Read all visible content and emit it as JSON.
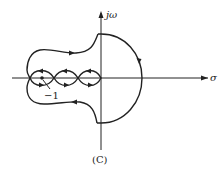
{
  "diagram": {
    "type": "nyquist-contour",
    "caption": "(C)",
    "axes": {
      "horizontal_label": "σ",
      "vertical_label": "jω"
    },
    "annotations": [
      {
        "text": "−1",
        "points_to": "critical point (-1, 0)"
      }
    ],
    "colors": {
      "stroke": "#222222",
      "background": "#ffffff"
    }
  }
}
